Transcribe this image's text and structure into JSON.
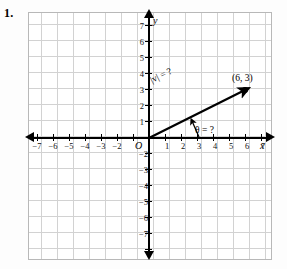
{
  "problem": {
    "number": "1."
  },
  "figure": {
    "type": "coordinate-plane-vector-diagram",
    "axis_labels": {
      "x": "x",
      "y": "y",
      "origin": "O"
    },
    "x_ticks": [
      {
        "value": -7,
        "label": "−7"
      },
      {
        "value": -6,
        "label": "−6"
      },
      {
        "value": -5,
        "label": "−5"
      },
      {
        "value": -4,
        "label": "−4"
      },
      {
        "value": -3,
        "label": "−3"
      },
      {
        "value": -2,
        "label": "−2"
      },
      {
        "value": -1,
        "label": ""
      },
      {
        "value": 1,
        "label": "1"
      },
      {
        "value": 2,
        "label": "2"
      },
      {
        "value": 3,
        "label": "3"
      },
      {
        "value": 4,
        "label": "4"
      },
      {
        "value": 5,
        "label": "5"
      },
      {
        "value": 6,
        "label": "6"
      },
      {
        "value": 7,
        "label": "7"
      }
    ],
    "y_ticks": [
      {
        "value": 7,
        "label": "7"
      },
      {
        "value": 6,
        "label": "6"
      },
      {
        "value": 5,
        "label": "5"
      },
      {
        "value": 4,
        "label": "4"
      },
      {
        "value": 3,
        "label": "3"
      },
      {
        "value": 2,
        "label": "2"
      },
      {
        "value": 1,
        "label": "1"
      },
      {
        "value": -1,
        "label": ""
      },
      {
        "value": -2,
        "label": "−2"
      },
      {
        "value": -3,
        "label": "−3"
      },
      {
        "value": -4,
        "label": "−4"
      },
      {
        "value": -5,
        "label": "−5"
      },
      {
        "value": -6,
        "label": "−6"
      },
      {
        "value": -7,
        "label": "−7"
      }
    ],
    "vector": {
      "start": [
        0,
        0
      ],
      "end": [
        6,
        3
      ],
      "endpoint_label": "(6, 3)",
      "magnitude_label": "|v| = ?",
      "angle_label": "θ = ?"
    },
    "grid": {
      "spacing_units": 1,
      "visible": true
    },
    "colors": {
      "grid": "#d2d2d2",
      "axis": "#000000",
      "vector": "#000000",
      "frame": "#b8b8b8"
    }
  }
}
